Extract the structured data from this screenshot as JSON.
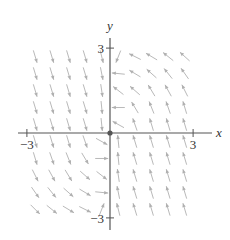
{
  "chart_data": {
    "type": "vector-field",
    "title": "",
    "xlabel": "x",
    "ylabel": "y",
    "xlim": [
      -3.3,
      3.3
    ],
    "ylim": [
      -3.3,
      3.3
    ],
    "x_ticks": [
      {
        "value": -3,
        "label": "−3"
      },
      {
        "value": 3,
        "label": "3"
      }
    ],
    "y_ticks": [
      {
        "value": 3,
        "label": "3"
      },
      {
        "value": -3,
        "label": "−3"
      }
    ],
    "origin_marker": true,
    "grid": false,
    "field_description": "Left half-plane vectors point down and slightly right; right half-plane vectors point up and slightly left; near the y-axis vectors turn horizontal (leftward for y>0, x>0; rightward for y<0, x<0).",
    "sample_spacing": 0.6,
    "vectors": [
      {
        "x": -2.7,
        "y": 2.7,
        "dx": 0.3,
        "dy": -1
      },
      {
        "x": -2.1,
        "y": 2.7,
        "dx": 0.3,
        "dy": -1
      },
      {
        "x": -1.5,
        "y": 2.7,
        "dx": 0.3,
        "dy": -1
      },
      {
        "x": -0.9,
        "y": 2.7,
        "dx": 0.3,
        "dy": -1
      },
      {
        "x": -0.3,
        "y": 2.7,
        "dx": 0.25,
        "dy": -1
      },
      {
        "x": 0.3,
        "y": 2.7,
        "dx": -0.4,
        "dy": -1
      },
      {
        "x": 0.9,
        "y": 2.7,
        "dx": -1,
        "dy": 0.5
      },
      {
        "x": 1.5,
        "y": 2.7,
        "dx": -1,
        "dy": 0.6
      },
      {
        "x": 2.1,
        "y": 2.7,
        "dx": -1,
        "dy": 0.8
      },
      {
        "x": 2.7,
        "y": 2.7,
        "dx": -1,
        "dy": 0.9
      },
      {
        "x": -2.7,
        "y": 2.1,
        "dx": 0.3,
        "dy": -1
      },
      {
        "x": -2.1,
        "y": 2.1,
        "dx": 0.3,
        "dy": -1
      },
      {
        "x": -1.5,
        "y": 2.1,
        "dx": 0.3,
        "dy": -1
      },
      {
        "x": -0.9,
        "y": 2.1,
        "dx": 0.3,
        "dy": -1
      },
      {
        "x": -0.3,
        "y": 2.1,
        "dx": 0.2,
        "dy": -1
      },
      {
        "x": 0.3,
        "y": 2.1,
        "dx": -1,
        "dy": 0.1
      },
      {
        "x": 0.9,
        "y": 2.1,
        "dx": -1,
        "dy": 0.6
      },
      {
        "x": 1.5,
        "y": 2.1,
        "dx": -0.9,
        "dy": 0.8
      },
      {
        "x": 2.1,
        "y": 2.1,
        "dx": -0.8,
        "dy": 1
      },
      {
        "x": 2.7,
        "y": 2.1,
        "dx": -0.7,
        "dy": 1
      },
      {
        "x": -2.7,
        "y": 1.5,
        "dx": 0.3,
        "dy": -1
      },
      {
        "x": -2.1,
        "y": 1.5,
        "dx": 0.3,
        "dy": -1
      },
      {
        "x": -1.5,
        "y": 1.5,
        "dx": 0.3,
        "dy": -1
      },
      {
        "x": -0.9,
        "y": 1.5,
        "dx": 0.3,
        "dy": -1
      },
      {
        "x": -0.3,
        "y": 1.5,
        "dx": 0.15,
        "dy": -1
      },
      {
        "x": 0.3,
        "y": 1.5,
        "dx": -0.9,
        "dy": 0.7
      },
      {
        "x": 0.9,
        "y": 1.5,
        "dx": -0.8,
        "dy": 0.7
      },
      {
        "x": 1.5,
        "y": 1.5,
        "dx": -0.6,
        "dy": 1
      },
      {
        "x": 2.1,
        "y": 1.5,
        "dx": -0.55,
        "dy": 1
      },
      {
        "x": 2.7,
        "y": 1.5,
        "dx": -0.5,
        "dy": 1
      },
      {
        "x": -2.7,
        "y": 0.9,
        "dx": 0.3,
        "dy": -1
      },
      {
        "x": -2.1,
        "y": 0.9,
        "dx": 0.3,
        "dy": -1
      },
      {
        "x": -1.5,
        "y": 0.9,
        "dx": 0.3,
        "dy": -1
      },
      {
        "x": -0.9,
        "y": 0.9,
        "dx": 0.3,
        "dy": -1
      },
      {
        "x": -0.3,
        "y": 0.9,
        "dx": 0.1,
        "dy": -1
      },
      {
        "x": 0.3,
        "y": 0.9,
        "dx": -1,
        "dy": 0
      },
      {
        "x": 0.9,
        "y": 0.9,
        "dx": -0.6,
        "dy": 1
      },
      {
        "x": 1.5,
        "y": 0.9,
        "dx": -0.4,
        "dy": 1
      },
      {
        "x": 2.1,
        "y": 0.9,
        "dx": -0.35,
        "dy": 1
      },
      {
        "x": 2.7,
        "y": 0.9,
        "dx": -0.3,
        "dy": 1
      },
      {
        "x": -2.7,
        "y": 0.3,
        "dx": 0.3,
        "dy": -1
      },
      {
        "x": -2.1,
        "y": 0.3,
        "dx": 0.3,
        "dy": -1
      },
      {
        "x": -1.5,
        "y": 0.3,
        "dx": 0.3,
        "dy": -1
      },
      {
        "x": -0.9,
        "y": 0.3,
        "dx": 0.3,
        "dy": -1
      },
      {
        "x": -0.3,
        "y": 0.3,
        "dx": 0.1,
        "dy": -1
      },
      {
        "x": 0.3,
        "y": 0.3,
        "dx": -0.9,
        "dy": 0.5
      },
      {
        "x": 0.9,
        "y": 0.3,
        "dx": -0.35,
        "dy": 1
      },
      {
        "x": 1.5,
        "y": 0.3,
        "dx": -0.3,
        "dy": 1
      },
      {
        "x": 2.1,
        "y": 0.3,
        "dx": -0.3,
        "dy": 1
      },
      {
        "x": 2.7,
        "y": 0.3,
        "dx": -0.3,
        "dy": 1
      },
      {
        "x": -2.7,
        "y": -0.3,
        "dx": 0.3,
        "dy": -1
      },
      {
        "x": -2.1,
        "y": -0.3,
        "dx": 0.3,
        "dy": -1
      },
      {
        "x": -1.5,
        "y": -0.3,
        "dx": 0.3,
        "dy": -1
      },
      {
        "x": -0.9,
        "y": -0.3,
        "dx": 0.35,
        "dy": -1
      },
      {
        "x": -0.3,
        "y": -0.3,
        "dx": 0.9,
        "dy": -0.5
      },
      {
        "x": 0.3,
        "y": -0.3,
        "dx": -0.1,
        "dy": 1
      },
      {
        "x": 0.9,
        "y": -0.3,
        "dx": -0.3,
        "dy": 1
      },
      {
        "x": 1.5,
        "y": -0.3,
        "dx": -0.3,
        "dy": 1
      },
      {
        "x": 2.1,
        "y": -0.3,
        "dx": -0.3,
        "dy": 1
      },
      {
        "x": 2.7,
        "y": -0.3,
        "dx": -0.3,
        "dy": 1
      },
      {
        "x": -2.7,
        "y": -0.9,
        "dx": 0.3,
        "dy": -1
      },
      {
        "x": -2.1,
        "y": -0.9,
        "dx": 0.35,
        "dy": -1
      },
      {
        "x": -1.5,
        "y": -0.9,
        "dx": 0.4,
        "dy": -1
      },
      {
        "x": -0.9,
        "y": -0.9,
        "dx": 0.6,
        "dy": -1
      },
      {
        "x": -0.3,
        "y": -0.9,
        "dx": 1,
        "dy": 0
      },
      {
        "x": 0.3,
        "y": -0.9,
        "dx": -0.1,
        "dy": 1
      },
      {
        "x": 0.9,
        "y": -0.9,
        "dx": -0.3,
        "dy": 1
      },
      {
        "x": 1.5,
        "y": -0.9,
        "dx": -0.3,
        "dy": 1
      },
      {
        "x": 2.1,
        "y": -0.9,
        "dx": -0.3,
        "dy": 1
      },
      {
        "x": 2.7,
        "y": -0.9,
        "dx": -0.3,
        "dy": 1
      },
      {
        "x": -2.7,
        "y": -1.5,
        "dx": 0.5,
        "dy": -1
      },
      {
        "x": -2.1,
        "y": -1.5,
        "dx": 0.55,
        "dy": -1
      },
      {
        "x": -1.5,
        "y": -1.5,
        "dx": 0.6,
        "dy": -1
      },
      {
        "x": -0.9,
        "y": -1.5,
        "dx": 0.8,
        "dy": -0.7
      },
      {
        "x": -0.3,
        "y": -1.5,
        "dx": 0.9,
        "dy": -0.7
      },
      {
        "x": 0.3,
        "y": -1.5,
        "dx": -0.15,
        "dy": 1
      },
      {
        "x": 0.9,
        "y": -1.5,
        "dx": -0.3,
        "dy": 1
      },
      {
        "x": 1.5,
        "y": -1.5,
        "dx": -0.3,
        "dy": 1
      },
      {
        "x": 2.1,
        "y": -1.5,
        "dx": -0.3,
        "dy": 1
      },
      {
        "x": 2.7,
        "y": -1.5,
        "dx": -0.3,
        "dy": 1
      },
      {
        "x": -2.7,
        "y": -2.1,
        "dx": 0.7,
        "dy": -1
      },
      {
        "x": -2.1,
        "y": -2.1,
        "dx": 0.8,
        "dy": -1
      },
      {
        "x": -1.5,
        "y": -2.1,
        "dx": 0.9,
        "dy": -0.8
      },
      {
        "x": -0.9,
        "y": -2.1,
        "dx": 1,
        "dy": -0.6
      },
      {
        "x": -0.3,
        "y": -2.1,
        "dx": 1,
        "dy": -0.1
      },
      {
        "x": 0.3,
        "y": -2.1,
        "dx": -0.2,
        "dy": 1
      },
      {
        "x": 0.9,
        "y": -2.1,
        "dx": -0.3,
        "dy": 1
      },
      {
        "x": 1.5,
        "y": -2.1,
        "dx": -0.3,
        "dy": 1
      },
      {
        "x": 2.1,
        "y": -2.1,
        "dx": -0.3,
        "dy": 1
      },
      {
        "x": 2.7,
        "y": -2.1,
        "dx": -0.3,
        "dy": 1
      },
      {
        "x": -2.7,
        "y": -2.7,
        "dx": 0.9,
        "dy": -0.9
      },
      {
        "x": -2.1,
        "y": -2.7,
        "dx": 1,
        "dy": -0.8
      },
      {
        "x": -1.5,
        "y": -2.7,
        "dx": 1,
        "dy": -0.6
      },
      {
        "x": -0.9,
        "y": -2.7,
        "dx": 1,
        "dy": -0.5
      },
      {
        "x": -0.3,
        "y": -2.7,
        "dx": 0.4,
        "dy": 1
      },
      {
        "x": 0.3,
        "y": -2.7,
        "dx": -0.25,
        "dy": 1
      },
      {
        "x": 0.9,
        "y": -2.7,
        "dx": -0.3,
        "dy": 1
      },
      {
        "x": 1.5,
        "y": -2.7,
        "dx": -0.3,
        "dy": 1
      },
      {
        "x": 2.1,
        "y": -2.7,
        "dx": -0.3,
        "dy": 1
      },
      {
        "x": 2.7,
        "y": -2.7,
        "dx": -0.3,
        "dy": 1
      }
    ],
    "colors": {
      "axis": "#555555",
      "vector": "#b9b9b9"
    }
  }
}
